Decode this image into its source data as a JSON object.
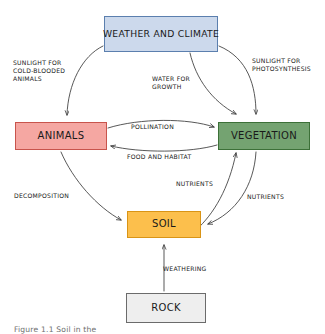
{
  "diagram": {
    "caption": "Figure 1.1 Soil in the",
    "nodes": [
      {
        "id": "weather",
        "label": "WEATHER AND CLIMATE",
        "fill": "#ccd9ec",
        "border": "#5b7fae"
      },
      {
        "id": "animals",
        "label": "ANIMALS",
        "fill": "#f5a7a2",
        "border": "#c8544c"
      },
      {
        "id": "vegetation",
        "label": "VEGETATION",
        "fill": "#74a371",
        "border": "#3c7038"
      },
      {
        "id": "soil",
        "label": "SOIL",
        "fill": "#fcbf4c",
        "border": "#d99416"
      },
      {
        "id": "rock",
        "label": "ROCK",
        "fill": "#eeeeee",
        "border": "#6b6b6b"
      }
    ],
    "edges": [
      {
        "id": "sunlight-cold",
        "label": "SUNLIGHT FOR\nCOLD-BLOODED\nANIMALS",
        "from": "weather",
        "to": "animals"
      },
      {
        "id": "sunlight-photo",
        "label": "SUNLIGHT FOR\nPHOTOSYNTHESIS",
        "from": "weather",
        "to": "vegetation"
      },
      {
        "id": "water-growth",
        "label": "WATER FOR\nGROWTH",
        "from": "weather",
        "to": "vegetation"
      },
      {
        "id": "pollination",
        "label": "POLLINATION",
        "from": "animals",
        "to": "vegetation"
      },
      {
        "id": "food-habitat",
        "label": "FOOD AND HABITAT",
        "from": "vegetation",
        "to": "animals"
      },
      {
        "id": "decomposition",
        "label": "DECOMPOSITION",
        "from": "animals",
        "to": "soil"
      },
      {
        "id": "nutrients-up",
        "label": "NUTRIENTS",
        "from": "soil",
        "to": "vegetation"
      },
      {
        "id": "nutrients-down",
        "label": "NUTRIENTS",
        "from": "vegetation",
        "to": "soil"
      },
      {
        "id": "weathering",
        "label": "WEATHERING",
        "from": "rock",
        "to": "soil"
      }
    ],
    "colors": {
      "stroke": "#3a3a3a",
      "background": "#ffffff",
      "text": "#1a1a1a",
      "caption": "#6d6d6d"
    }
  }
}
